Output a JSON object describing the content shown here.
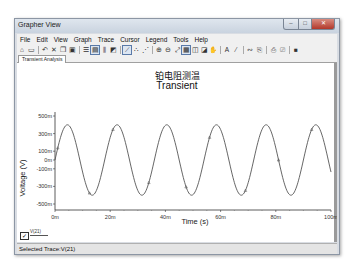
{
  "window": {
    "title": "Grapher View",
    "controls": {
      "minimize": "–",
      "maximize": "□",
      "close": "✕"
    }
  },
  "menu": {
    "items": [
      "File",
      "Edit",
      "View",
      "Graph",
      "Trace",
      "Cursor",
      "Legend",
      "Tools",
      "Help"
    ]
  },
  "toolbar": {
    "buttons": [
      {
        "name": "open-icon",
        "glyph": "⌂"
      },
      {
        "name": "save-icon",
        "glyph": "▭"
      },
      {
        "sep": true
      },
      {
        "name": "undo-icon",
        "glyph": "↶"
      },
      {
        "name": "cut-icon",
        "glyph": "✕"
      },
      {
        "name": "copy-icon",
        "glyph": "❐"
      },
      {
        "name": "paste-icon",
        "glyph": "▣"
      },
      {
        "sep": true
      },
      {
        "name": "grid-icon",
        "glyph": "☰"
      },
      {
        "name": "graph-icon",
        "glyph": "▤",
        "selected": true
      },
      {
        "name": "bars-icon",
        "glyph": "⫼"
      },
      {
        "name": "overlay-icon",
        "glyph": "◩"
      },
      {
        "sep": true
      },
      {
        "name": "trace-icon",
        "glyph": "⟋",
        "selected": true
      },
      {
        "name": "scatter-icon",
        "glyph": "∴"
      },
      {
        "name": "peaks-icon",
        "glyph": "⋰"
      },
      {
        "sep": true
      },
      {
        "name": "zoom-in-icon",
        "glyph": "⊕"
      },
      {
        "name": "zoom-out-icon",
        "glyph": "⊖"
      },
      {
        "name": "zoom-fit-icon",
        "glyph": "⤢"
      },
      {
        "name": "zoom-area-icon",
        "glyph": "▦",
        "selected": true
      },
      {
        "name": "zoom-x-icon",
        "glyph": "◫"
      },
      {
        "name": "zoom-y-icon",
        "glyph": "◪"
      },
      {
        "name": "pan-icon",
        "glyph": "✋"
      },
      {
        "sep": true
      },
      {
        "name": "text-icon",
        "glyph": "A"
      },
      {
        "name": "cursor-icon",
        "glyph": "⁄"
      },
      {
        "sep": true
      },
      {
        "name": "measure-icon",
        "glyph": "∾"
      },
      {
        "name": "export-icon",
        "glyph": "⎘"
      },
      {
        "sep": true
      },
      {
        "name": "print-icon",
        "glyph": "⎙"
      },
      {
        "name": "print-preview-icon",
        "glyph": "⎚"
      },
      {
        "sep": true
      },
      {
        "name": "properties-icon",
        "glyph": "■"
      }
    ]
  },
  "tabs": [
    {
      "label": "Transient Analysis",
      "active": true
    }
  ],
  "chart": {
    "title_cn": "铂电阻测温",
    "title_en": "Transient"
  },
  "chart_data": {
    "type": "line",
    "xlabel": "Time (s)",
    "ylabel": "Voltage (V)",
    "xlim": [
      0,
      0.1
    ],
    "ylim": [
      -0.5,
      0.5
    ],
    "x_ticks": [
      "0m",
      "20m",
      "40m",
      "60m",
      "80m",
      "100m"
    ],
    "y_ticks": [
      "500m",
      "300m",
      "100m",
      "0m",
      "-100m",
      "-300m",
      "-500m"
    ],
    "grid": false,
    "legend_position": "bottom-left",
    "series": [
      {
        "name": "V(21)",
        "color": "#555555",
        "shape": "sine",
        "amplitude": 0.4,
        "offset": 0.0,
        "period": 0.018,
        "phase_start": 0.0,
        "x": [
          0,
          0.0045,
          0.009,
          0.0135,
          0.018,
          0.0225,
          0.027,
          0.0315,
          0.036,
          0.0405,
          0.045,
          0.0495,
          0.054,
          0.0585,
          0.063,
          0.0675,
          0.072,
          0.0765,
          0.081,
          0.0855,
          0.09,
          0.0945,
          0.099
        ],
        "y": [
          0,
          0.4,
          0,
          -0.4,
          0,
          0.4,
          0,
          -0.4,
          0,
          0.4,
          0,
          -0.4,
          0,
          0.4,
          0,
          -0.4,
          0,
          0.4,
          0,
          -0.4,
          0,
          0.4,
          0.07
        ]
      }
    ]
  },
  "legend": {
    "items": [
      {
        "label": "V(21)",
        "checked": true
      }
    ]
  },
  "status": {
    "text": "Selected Trace:V(21)"
  }
}
